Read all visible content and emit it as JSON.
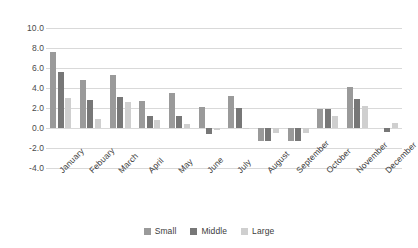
{
  "chart_data": {
    "type": "bar",
    "title": "",
    "subtitle": "",
    "xlabel": "",
    "ylabel": "",
    "ylim": [
      -4.0,
      10.0
    ],
    "ytick_values": [
      10.0,
      8.0,
      6.0,
      4.0,
      2.0,
      0.0,
      -2.0,
      -4.0
    ],
    "ytick_labels": [
      "10.0",
      "8.0",
      "6.0",
      "4.0",
      "2.0",
      "0.0",
      "-2.0",
      "-4.0"
    ],
    "grid": true,
    "legend_position": "bottom",
    "categories": [
      "January",
      "Febuary",
      "March",
      "April",
      "May",
      "June",
      "July",
      "August",
      "September",
      "October",
      "November",
      "December"
    ],
    "series": [
      {
        "name": "Small",
        "color": "#9a9a9a",
        "values": [
          7.6,
          4.8,
          5.3,
          2.7,
          3.55,
          2.1,
          3.2,
          -1.3,
          -1.25,
          1.9,
          4.1,
          0.0
        ]
      },
      {
        "name": "Middle",
        "color": "#777777",
        "values": [
          5.6,
          2.85,
          3.1,
          1.25,
          1.25,
          -0.55,
          2.0,
          -1.3,
          -1.3,
          1.9,
          2.9,
          -0.35
        ]
      },
      {
        "name": "Large",
        "color": "#cfcfcf",
        "values": [
          3.0,
          0.9,
          2.6,
          0.8,
          0.4,
          -0.15,
          0.05,
          -0.45,
          -0.5,
          1.2,
          2.2,
          0.5
        ]
      }
    ]
  }
}
